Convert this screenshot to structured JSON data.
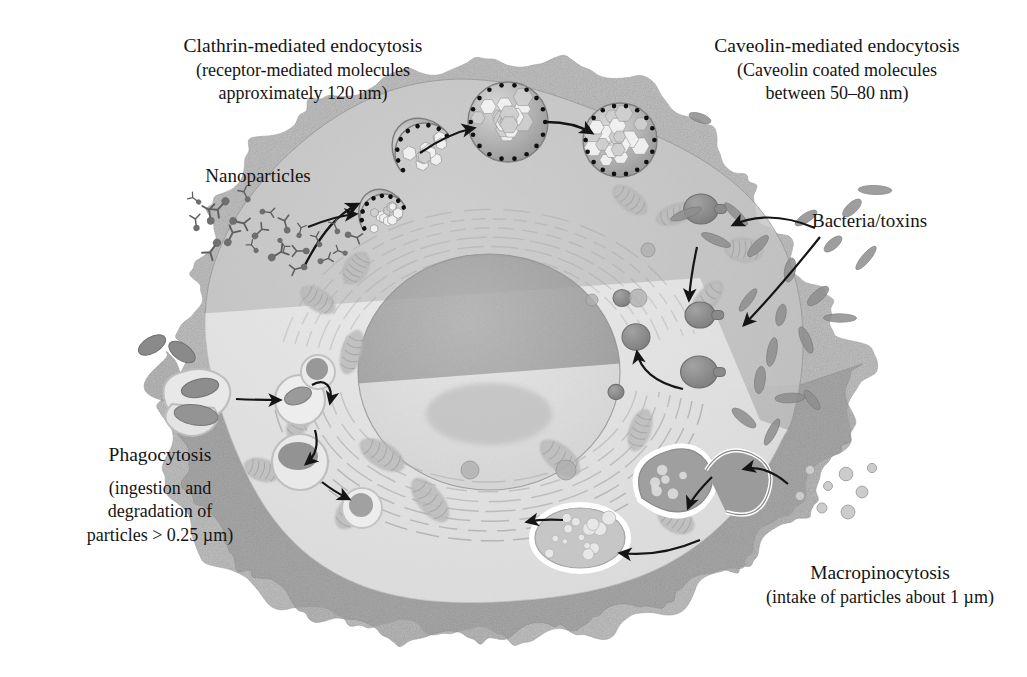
{
  "figure": {
    "background_color": "#ffffff",
    "text_color": "#141414"
  },
  "labels": {
    "clathrin": {
      "title": "Clathrin-mediated endocytosis",
      "line2": "(receptor-mediated molecules",
      "line3": "approximately 120 nm)"
    },
    "caveolin": {
      "title": "Caveolin-mediated endocytosis",
      "line2": "(Caveolin coated molecules",
      "line3": "between 50–80 nm)"
    },
    "nanoparticles": {
      "title": "Nanoparticles"
    },
    "bacteria": {
      "title": "Bacteria/toxins"
    },
    "phagocytosis": {
      "title": "Phagocytosis",
      "line2": "(ingestion and",
      "line3": "degradation of",
      "line4": "particles > 0.25 µm)"
    },
    "macropinocytosis": {
      "title": "Macropinocytosis",
      "line2": "(intake of particles about 1 µm)"
    }
  },
  "colors": {
    "cell_upper": "#c9c9c9",
    "cell_lower_cut": "#ececec",
    "membrane_ruffle": "#a9a9a9",
    "membrane_ruffle_dark": "#9c9c9c",
    "nucleus_upper": "#9d9d9d",
    "nucleus_lower": "#dcdcdc",
    "organelle": "#b4b4b4",
    "vesicle_cargo": "#8d8d8d",
    "arrow": "#151515",
    "clathrin_coat": "#8f8f8f",
    "clathrin_dot": "#101010",
    "outline": "#767676"
  },
  "structures": {
    "clathrin_pathway": {
      "name": "clathrin-mediated endocytosis pathway",
      "stages": [
        "coated pit",
        "budding pit",
        "coated vesicle",
        "internalized coated vesicle"
      ],
      "cargo_size_nm": 120
    },
    "caveolin_pathway": {
      "name": "caveolin-mediated endocytosis pathway",
      "cargo_size_nm": "50-80"
    },
    "phagocytosis_pathway": {
      "name": "phagocytosis pathway",
      "stages": [
        "phagocytic cup",
        "phagosome",
        "early phagolysosome",
        "late phagolysosome",
        "residual body"
      ],
      "particle_size_um": "> 0.25"
    },
    "macropinocytosis_pathway": {
      "name": "macropinocytosis pathway",
      "stages": [
        "membrane ruffle",
        "macropinosome closing",
        "macropinosome"
      ],
      "particle_size_um": "about 1"
    },
    "nucleus": {
      "name": "nucleus"
    },
    "nucleolus": {
      "name": "nucleolus"
    },
    "golgi": {
      "name": "golgi apparatus"
    },
    "mitochondria": {
      "name": "mitochondria"
    },
    "cut_plane": {
      "name": "cut-away section plane"
    }
  }
}
